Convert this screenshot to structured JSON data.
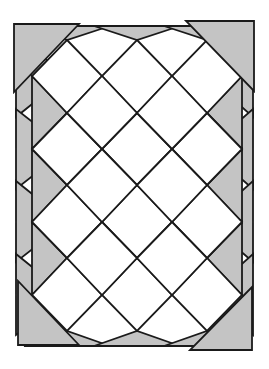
{
  "diagram": {
    "colors": {
      "white_fill": "#ffffff",
      "gray_fill": "#c4c4c4",
      "line": "#1a1a1a"
    },
    "lattice": {
      "row_y": [
        40,
        76,
        113,
        149,
        185,
        222,
        258,
        295,
        331
      ],
      "even_row_x": [
        67,
        137,
        207
      ],
      "odd_row_x": [
        32,
        102,
        172,
        242
      ]
    },
    "corner_triangles": [
      {
        "name": "top-left",
        "points": [
          [
            14,
            24
          ],
          [
            79,
            24
          ],
          [
            14,
            92
          ]
        ]
      },
      {
        "name": "top-right",
        "points": [
          [
            186,
            21
          ],
          [
            254,
            21
          ],
          [
            254,
            91
          ]
        ]
      },
      {
        "name": "bottom-left",
        "points": [
          [
            18,
            281
          ],
          [
            18,
            345
          ],
          [
            79,
            345
          ]
        ]
      },
      {
        "name": "bottom-right",
        "points": [
          [
            252,
            287
          ],
          [
            252,
            350
          ],
          [
            190,
            350
          ]
        ]
      }
    ],
    "counts": {
      "white_squares": 18,
      "gray_edge_triangles": 14,
      "gray_corner_triangles": 4
    }
  }
}
